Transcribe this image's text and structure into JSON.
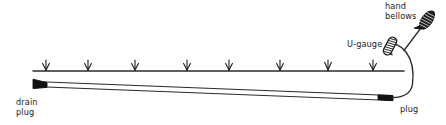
{
  "diagram": {
    "type": "technical-line-drawing",
    "canvas": {
      "width": 446,
      "height": 125
    },
    "colors": {
      "ink": "#1a1a1a",
      "line": "#2b2b2b",
      "background": "#ffffff",
      "fill_dark": "#111111"
    },
    "labels": {
      "hand_bellows_line1": "hand",
      "hand_bellows_line2": "bellows",
      "u_gauge": "U-gauge",
      "drain_plug_line1": "drain",
      "drain_plug_line2": "plug",
      "plug": "plug"
    },
    "ground_line": {
      "name": "ground-level-line",
      "x_start": 33,
      "x_end": 404,
      "y": 71,
      "arrow_count": 8,
      "arrow_x_positions": [
        46,
        88,
        135,
        187,
        229,
        280,
        328,
        373
      ],
      "arrow_top_y": 60,
      "arrow_tip_y": 70
    },
    "pipe": {
      "name": "sloped-drain-pipe",
      "left_x": 33,
      "left_y_top": 81,
      "left_y_bottom": 86,
      "right_x": 392,
      "right_y_top": 95,
      "right_y_bottom": 100,
      "slope_description": "descending left to right"
    },
    "tube": {
      "name": "flexible-connection-tube",
      "from": "plug",
      "to": "hand-bellows",
      "loop": true
    },
    "components": [
      {
        "id": "drain-plug",
        "label": "drain plug",
        "position": "left-end-of-pipe"
      },
      {
        "id": "plug",
        "label": "plug",
        "position": "right-end-of-pipe"
      },
      {
        "id": "u-gauge",
        "label": "U-gauge",
        "position": "above-pipe-right"
      },
      {
        "id": "hand-bellows",
        "label": "hand bellows",
        "position": "top-right"
      }
    ]
  }
}
